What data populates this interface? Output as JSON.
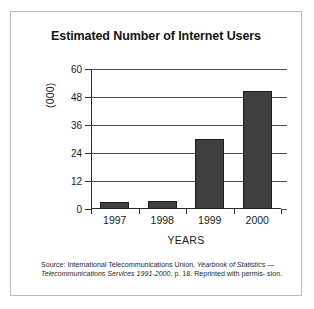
{
  "figure": {
    "title": "Estimated Number of Internet Users",
    "frame_color": "#b9b9b9",
    "background": "#ffffff"
  },
  "axes": {
    "y_title": "(000)",
    "x_title": "YEARS",
    "y_ticks": [
      "0",
      "12",
      "24",
      "36",
      "48",
      "60"
    ],
    "x_ticks": [
      "1997",
      "1998",
      "1999",
      "2000"
    ]
  },
  "source": {
    "line1_plain": "Source: International Telecommunications Union, ",
    "line1_italic": "Yearbook of Statistics",
    "line2_dash": "— ",
    "line2_italic": "Telecommunications Services 1991-2000",
    "line2_plain": ", p. 18. Reprinted with permis-",
    "line3_plain": "sion."
  },
  "chart_data": {
    "type": "bar",
    "title": "Estimated Number of Internet Users",
    "xlabel": "YEARS",
    "ylabel": "(000)",
    "categories": [
      "1997",
      "1998",
      "1999",
      "2000"
    ],
    "values": [
      3,
      3.3,
      30,
      50.5
    ],
    "ylim": [
      0,
      60
    ],
    "yticks": [
      0,
      12,
      24,
      36,
      48,
      60
    ],
    "grid": true,
    "legend": false,
    "bar_color": "#404040",
    "bar_edge_color": "#1c1c1c"
  }
}
